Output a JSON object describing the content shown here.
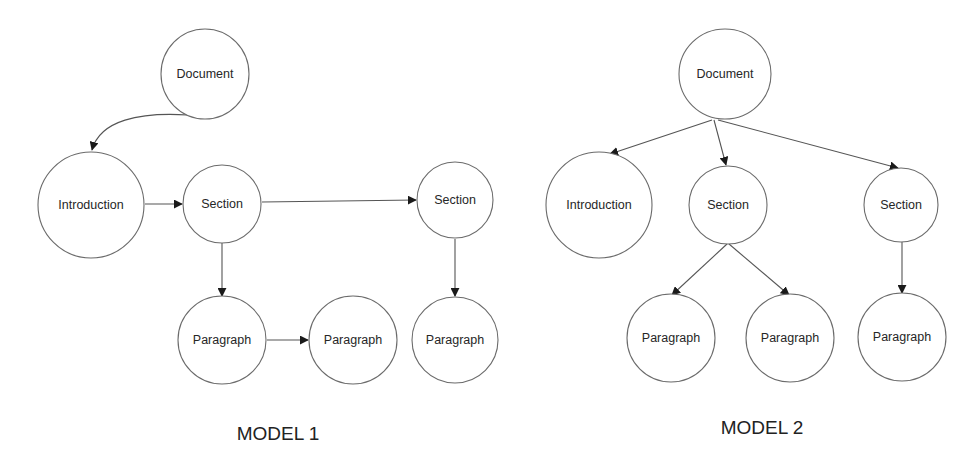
{
  "figure": {
    "models": [
      {
        "id": "model1",
        "caption": "MODEL 1",
        "structure": "linked-sequence",
        "nodes": [
          {
            "id": "m1-document",
            "label": "Document"
          },
          {
            "id": "m1-introduction",
            "label": "Introduction"
          },
          {
            "id": "m1-section-1",
            "label": "Section"
          },
          {
            "id": "m1-section-2",
            "label": "Section"
          },
          {
            "id": "m1-paragraph-1",
            "label": "Paragraph"
          },
          {
            "id": "m1-paragraph-2",
            "label": "Paragraph"
          },
          {
            "id": "m1-paragraph-3",
            "label": "Paragraph"
          }
        ],
        "edges": [
          {
            "from": "m1-document",
            "to": "m1-introduction",
            "style": "curved"
          },
          {
            "from": "m1-introduction",
            "to": "m1-section-1"
          },
          {
            "from": "m1-section-1",
            "to": "m1-section-2"
          },
          {
            "from": "m1-section-1",
            "to": "m1-paragraph-1"
          },
          {
            "from": "m1-paragraph-1",
            "to": "m1-paragraph-2"
          },
          {
            "from": "m1-section-2",
            "to": "m1-paragraph-3"
          }
        ]
      },
      {
        "id": "model2",
        "caption": "MODEL 2",
        "structure": "tree",
        "nodes": [
          {
            "id": "m2-document",
            "label": "Document"
          },
          {
            "id": "m2-introduction",
            "label": "Introduction"
          },
          {
            "id": "m2-section-1",
            "label": "Section"
          },
          {
            "id": "m2-section-2",
            "label": "Section"
          },
          {
            "id": "m2-paragraph-1",
            "label": "Paragraph"
          },
          {
            "id": "m2-paragraph-2",
            "label": "Paragraph"
          },
          {
            "id": "m2-paragraph-3",
            "label": "Paragraph"
          }
        ],
        "edges": [
          {
            "from": "m2-document",
            "to": "m2-introduction"
          },
          {
            "from": "m2-document",
            "to": "m2-section-1"
          },
          {
            "from": "m2-document",
            "to": "m2-section-2"
          },
          {
            "from": "m2-section-1",
            "to": "m2-paragraph-1"
          },
          {
            "from": "m2-section-1",
            "to": "m2-paragraph-2"
          },
          {
            "from": "m2-section-2",
            "to": "m2-paragraph-3"
          }
        ]
      }
    ]
  },
  "colors": {
    "background": "#ffffff",
    "stroke": "#6b6b6b",
    "edge": "#555555",
    "text": "#262626"
  }
}
